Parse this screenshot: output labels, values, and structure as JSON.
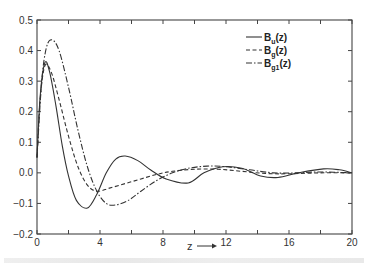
{
  "chart_data": {
    "type": "line",
    "title": "",
    "xlabel": "z →",
    "ylabel": "",
    "xlim": [
      0,
      20
    ],
    "ylim": [
      -0.2,
      0.5
    ],
    "grid": false,
    "legend_position": "upper right",
    "x_ticks": [
      "0",
      "4",
      "8",
      "12",
      "16",
      "20"
    ],
    "y_ticks": [
      "0.5",
      "0.4",
      "0.3",
      "0.2",
      "0.1",
      "0.0",
      "-0.1",
      "-0.2"
    ],
    "series": [
      {
        "name": "B_u(z)",
        "style": "solid",
        "points": [
          [
            0,
            0.05
          ],
          [
            0.2,
            0.25
          ],
          [
            0.5,
            0.36
          ],
          [
            0.8,
            0.33
          ],
          [
            1.2,
            0.22
          ],
          [
            1.6,
            0.09
          ],
          [
            2.0,
            -0.01
          ],
          [
            2.5,
            -0.09
          ],
          [
            3.2,
            -0.115
          ],
          [
            3.8,
            -0.07
          ],
          [
            4.4,
            0.0
          ],
          [
            5.0,
            0.045
          ],
          [
            5.6,
            0.055
          ],
          [
            6.4,
            0.04
          ],
          [
            7.2,
            0.01
          ],
          [
            8.2,
            -0.02
          ],
          [
            9.6,
            -0.033
          ],
          [
            10.6,
            0.0
          ],
          [
            11.8,
            0.02
          ],
          [
            13.0,
            0.015
          ],
          [
            14.2,
            -0.01
          ],
          [
            15.3,
            -0.015
          ],
          [
            16.6,
            0.0
          ],
          [
            18.2,
            0.013
          ],
          [
            19.2,
            0.01
          ],
          [
            20,
            0.0
          ]
        ]
      },
      {
        "name": "B_g(z)",
        "style": "dashed",
        "points": [
          [
            0,
            0.05
          ],
          [
            0.2,
            0.24
          ],
          [
            0.5,
            0.35
          ],
          [
            0.9,
            0.33
          ],
          [
            1.4,
            0.24
          ],
          [
            2.0,
            0.12
          ],
          [
            2.6,
            0.02
          ],
          [
            3.2,
            -0.04
          ],
          [
            3.8,
            -0.06
          ],
          [
            4.6,
            -0.05
          ],
          [
            5.6,
            -0.035
          ],
          [
            6.6,
            -0.02
          ],
          [
            7.6,
            -0.005
          ],
          [
            8.6,
            0.005
          ],
          [
            10,
            0.012
          ],
          [
            11.5,
            0.012
          ],
          [
            13,
            0.005
          ],
          [
            14.5,
            -0.002
          ],
          [
            16,
            -0.003
          ],
          [
            18,
            0.0
          ],
          [
            20,
            0.0
          ]
        ]
      },
      {
        "name": "B_g1(z)",
        "style": "dash-dot",
        "points": [
          [
            0,
            0.05
          ],
          [
            0.3,
            0.3
          ],
          [
            0.6,
            0.41
          ],
          [
            0.95,
            0.435
          ],
          [
            1.4,
            0.4
          ],
          [
            2.0,
            0.28
          ],
          [
            2.6,
            0.14
          ],
          [
            3.2,
            0.02
          ],
          [
            3.8,
            -0.06
          ],
          [
            4.4,
            -0.1
          ],
          [
            5.0,
            -0.105
          ],
          [
            5.8,
            -0.09
          ],
          [
            6.6,
            -0.06
          ],
          [
            7.6,
            -0.025
          ],
          [
            8.6,
            0.0
          ],
          [
            9.6,
            0.015
          ],
          [
            10.8,
            0.022
          ],
          [
            12,
            0.02
          ],
          [
            13.5,
            0.01
          ],
          [
            15,
            0.0
          ],
          [
            16.5,
            0.0
          ],
          [
            18,
            0.003
          ],
          [
            20,
            0.0
          ]
        ]
      }
    ]
  },
  "legend": {
    "items": [
      {
        "base": "B",
        "sub": "u",
        "suffix": "(z)",
        "style": "solid"
      },
      {
        "base": "B",
        "sub": "g",
        "suffix": "(z)",
        "style": "dashed"
      },
      {
        "base": "B",
        "sub": "g1",
        "suffix": "(z)",
        "style": "dash-dot"
      }
    ]
  },
  "axis": {
    "x_label": "z",
    "x_arrow": "→"
  },
  "colors": {
    "line": "#333333",
    "frame": "#444444",
    "text": "#333333"
  }
}
